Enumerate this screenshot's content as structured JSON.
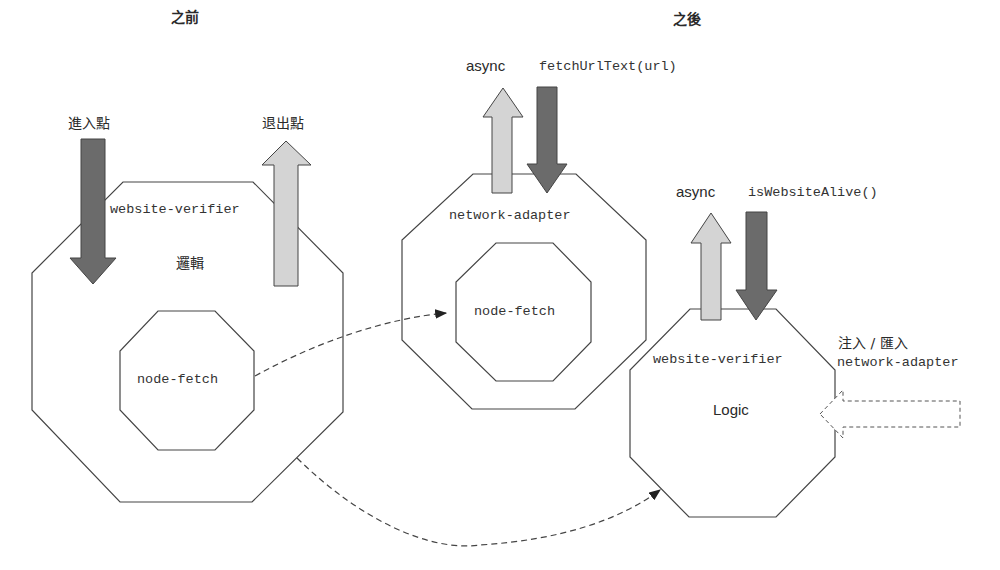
{
  "headings": {
    "before": "之前",
    "after": "之後"
  },
  "before": {
    "entry_label": "進入點",
    "exit_label": "退出點",
    "outer_module": "website-verifier",
    "logic_label": "邏輯",
    "inner_module": "node-fetch"
  },
  "after_adapter": {
    "return_label": "async",
    "call_label": "fetchUrlText(url)",
    "outer_module": "network-adapter",
    "inner_module": "node-fetch"
  },
  "after_verifier": {
    "return_label": "async",
    "call_label": "isWebsiteAlive()",
    "outer_module": "website-verifier",
    "logic_label": "Logic",
    "inject_label": "注入 / 匯入",
    "inject_module": "network-adapter"
  },
  "colors": {
    "dark_arrow": "#6b6b6b",
    "light_arrow": "#d4d4d4",
    "stroke": "#333333"
  }
}
